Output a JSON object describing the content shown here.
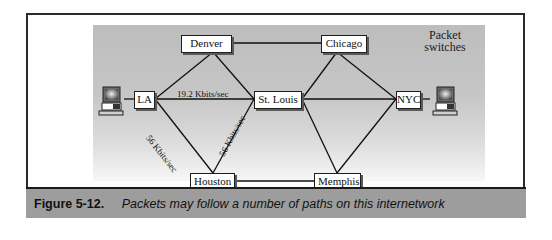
{
  "diagram": {
    "legend": "Packet switches",
    "legend_lines": [
      "Packet",
      "switches"
    ],
    "nodes": {
      "denver": "Denver",
      "chicago": "Chicago",
      "la": "LA",
      "st_louis": "St. Louis",
      "nyc": "NYC",
      "houston": "Houston",
      "memphis": "Memphis"
    },
    "links": {
      "la_st_louis": "19.2 Kbits/sec",
      "la_houston": "56 Kbits/sec",
      "houston_st_louis": "56 Kbits/sec"
    },
    "edges": [
      [
        "LA",
        "Denver"
      ],
      [
        "LA",
        "St. Louis"
      ],
      [
        "LA",
        "Houston"
      ],
      [
        "Denver",
        "St. Louis"
      ],
      [
        "Denver",
        "Chicago"
      ],
      [
        "Houston",
        "St. Louis"
      ],
      [
        "Houston",
        "Memphis"
      ],
      [
        "St. Louis",
        "Chicago"
      ],
      [
        "St. Louis",
        "NYC"
      ],
      [
        "St. Louis",
        "Memphis"
      ],
      [
        "Chicago",
        "NYC"
      ],
      [
        "Memphis",
        "NYC"
      ]
    ],
    "endpoints": [
      "computer-left",
      "computer-right"
    ]
  },
  "caption": {
    "figure": "Figure 5-12.",
    "text": "Packets may follow a number of paths on this internetwork"
  }
}
